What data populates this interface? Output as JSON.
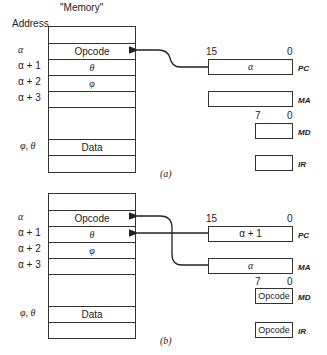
{
  "memory_title": "\"Memory\"",
  "address_label": "Address",
  "panels": [
    {
      "caption": "(a)",
      "addresses": [
        "α",
        "α + 1",
        "α + 2",
        "α + 3",
        "φ, θ"
      ],
      "memory_cells": {
        "opcode": "Opcode",
        "a1": "θ",
        "a2": "φ",
        "data": "Data"
      },
      "pc": {
        "value": "α",
        "label": "PC",
        "hi_bit": "15",
        "lo_bit": "0"
      },
      "ma": {
        "value": "",
        "label": "MA"
      },
      "md": {
        "value": "",
        "label": "MD",
        "hi_bit": "7",
        "lo_bit": "0"
      },
      "ir": {
        "value": "",
        "label": "IR"
      }
    },
    {
      "caption": "(b)",
      "addresses": [
        "α",
        "α + 1",
        "α + 2",
        "α + 3",
        "φ, θ"
      ],
      "memory_cells": {
        "opcode": "Opcode",
        "a1": "θ",
        "a2": "φ",
        "data": "Data"
      },
      "pc": {
        "value": "α + 1",
        "label": "PC",
        "hi_bit": "15",
        "lo_bit": "0"
      },
      "ma": {
        "value": "α",
        "label": "MA"
      },
      "md": {
        "value": "Opcode",
        "label": "MD",
        "hi_bit": "7",
        "lo_bit": "0"
      },
      "ir": {
        "value": "Opcode",
        "label": "IR"
      }
    }
  ]
}
